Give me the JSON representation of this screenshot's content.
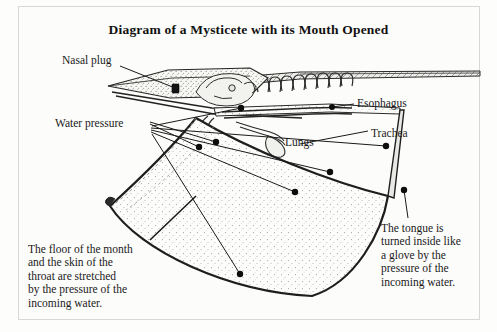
{
  "figure": {
    "title": "Diagram of a Mysticete with its Mouth Opened",
    "background_color": "#fcfcfa",
    "ink_color": "#1a1a1a",
    "frame_color": "#d8d8d4"
  },
  "labels": {
    "nasal_plug": "Nasal plug",
    "water_pressure": "Water pressure",
    "esophagus": "Esophagus",
    "trachea": "Trachea",
    "lungs": "Lungs"
  },
  "captions": {
    "floor_of_mouth": "The floor of the month\nand the skin of the\nthroat are stretched\nby the pressure of the\nincoming water.",
    "tongue": "The tongue is\nturned inside like\na glove by the\npressure of the\nincoming water."
  },
  "annotations": {
    "marker_count": 7,
    "marker_label": "leader-line-endpoint"
  }
}
